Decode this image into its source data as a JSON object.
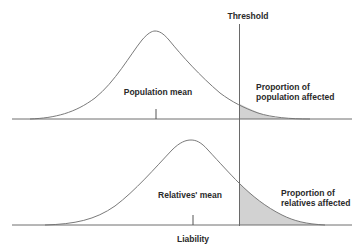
{
  "diagram": {
    "type": "liability-threshold-model",
    "threshold_label": "Threshold",
    "axis_label": "Liability",
    "colors": {
      "line": "#6e6e6e",
      "curve": "#7a7a7a",
      "shade": "#cfcfcf",
      "text": "#2a2a2a",
      "background": "#ffffff"
    },
    "panels": [
      {
        "id": "population",
        "mean_label": "Population mean",
        "affected_label_line1": "Proportion of",
        "affected_label_line2": "population affected"
      },
      {
        "id": "relatives",
        "mean_label": "Relatives' mean",
        "affected_label_line1": "Proportion of",
        "affected_label_line2": "relatives affected"
      }
    ]
  }
}
